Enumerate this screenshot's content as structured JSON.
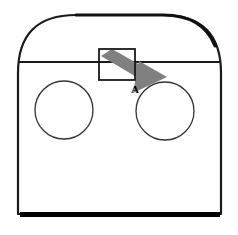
{
  "figure": {
    "type": "technical-line-drawing",
    "background_color": "#ffffff",
    "stroke_color": "#1a1a1a",
    "base_shadow_color": "#000000",
    "arrow_fill_color": "#808080",
    "canvas": {
      "width": 238,
      "height": 235
    }
  },
  "body_outline": {
    "name": "enclosure-outline",
    "left_x": 18,
    "right_x": 221,
    "top_y": 15,
    "bottom_y": 214,
    "arch_shoulder_y": 62,
    "corner_radius": 58,
    "stroke_width": 2.2
  },
  "waist_line": {
    "name": "horizontal-seam",
    "y": 62,
    "from_x": 18,
    "to_x": 221,
    "stroke_width": 1.8
  },
  "base_shadow": {
    "name": "base-shadow-bar",
    "x": 20,
    "y": 212,
    "width": 200,
    "height": 5
  },
  "circles": [
    {
      "name": "left-circle",
      "cx": 64,
      "cy": 110,
      "r": 29,
      "stroke_width": 1.3
    },
    {
      "name": "right-circle",
      "cx": 165,
      "cy": 111,
      "r": 29,
      "stroke_width": 1.3
    }
  ],
  "rectangle": {
    "name": "top-center-rectangle",
    "x": 99,
    "y": 49,
    "width": 36,
    "height": 31,
    "stroke_width": 1.8
  },
  "arrow": {
    "name": "callout-arrow",
    "fill": "#808080",
    "shaft_points": "101,55 113,50 155,73 143,80",
    "head_points": "138,62 165,76 134,92",
    "angle_degrees": 28,
    "direction": "down-right"
  },
  "labels": {
    "callout_a": {
      "name": "callout-label-a",
      "text": "A",
      "x": 135,
      "y": 93
    }
  }
}
